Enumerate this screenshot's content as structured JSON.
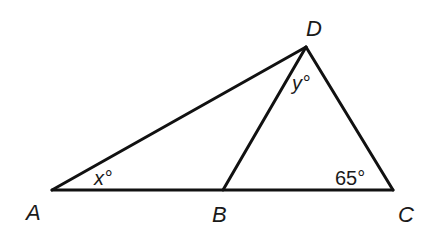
{
  "diagram": {
    "type": "geometry-triangle",
    "stroke_color": "#111111",
    "background": "#ffffff",
    "points": {
      "A": {
        "label": "A",
        "x": 52,
        "y": 190
      },
      "B": {
        "label": "B",
        "x": 223,
        "y": 190
      },
      "C": {
        "label": "C",
        "x": 393,
        "y": 190
      },
      "D": {
        "label": "D",
        "x": 306,
        "y": 47
      }
    },
    "segments": [
      "AC",
      "AD",
      "BD",
      "CD"
    ],
    "angles": {
      "at_A": {
        "label": "x°",
        "vertex": "A"
      },
      "at_D": {
        "label": "y°",
        "vertex": "D",
        "between": "BD and CD"
      },
      "at_C": {
        "label": "65°",
        "vertex": "C"
      }
    }
  }
}
